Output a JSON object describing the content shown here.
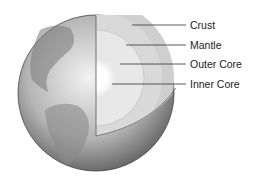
{
  "diagram": {
    "labels": [
      {
        "text": "Crust",
        "y": 19
      },
      {
        "text": "Mantle",
        "y": 39
      },
      {
        "text": "Outer Core",
        "y": 58
      },
      {
        "text": "Inner Core",
        "y": 78
      }
    ]
  }
}
